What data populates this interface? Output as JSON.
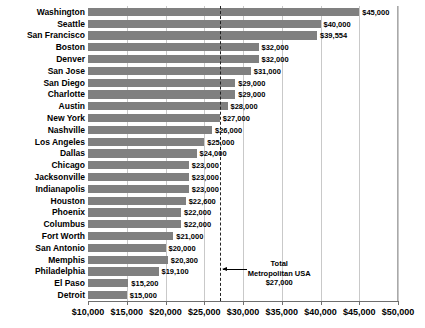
{
  "chart_data": {
    "type": "bar",
    "orientation": "horizontal",
    "title": "",
    "xlabel": "",
    "ylabel": "",
    "xlim": [
      10000,
      50000
    ],
    "xticks": [
      10000,
      15000,
      20000,
      25000,
      30000,
      35000,
      40000,
      45000,
      50000
    ],
    "xtick_labels": [
      "$10,000",
      "$15,000",
      "$20,000",
      "$25,000",
      "$30,000",
      "$35,000",
      "$40,000",
      "$45,000",
      "$50,000"
    ],
    "grid": true,
    "legend": "none",
    "bar_color": "#808080",
    "categories": [
      "Washington",
      "Seattle",
      "San Francisco",
      "Boston",
      "Denver",
      "San Jose",
      "San Diego",
      "Charlotte",
      "Austin",
      "New York",
      "Nashville",
      "Los Angeles",
      "Dallas",
      "Chicago",
      "Jacksonville",
      "Indianapolis",
      "Houston",
      "Phoenix",
      "Columbus",
      "Fort Worth",
      "San Antonio",
      "Memphis",
      "Philadelphia",
      "El Paso",
      "Detroit"
    ],
    "values": [
      45000,
      40000,
      39554,
      32000,
      32000,
      31000,
      29000,
      29000,
      28000,
      27000,
      26000,
      25000,
      24000,
      23000,
      23000,
      23000,
      22600,
      22000,
      22000,
      21000,
      20000,
      20300,
      19100,
      15200,
      15000
    ],
    "value_labels": [
      "$45,000",
      "$40,000",
      "$39,554",
      "$32,000",
      "$32,000",
      "$31,000",
      "$29,000",
      "$29,000",
      "$28,000",
      "$27,000",
      "$26,000",
      "$25,000",
      "$24,000",
      "$23,000",
      "$23,000",
      "$23,000",
      "$22,600",
      "$22,000",
      "$22,000",
      "$21,000",
      "$20,000",
      "$20,300",
      "$19,100",
      "$15,200",
      "$15,000"
    ],
    "annotation": {
      "line_value": 27000,
      "line_style": "dashed",
      "label_line1": "Total",
      "label_line2": "Metropolitan USA",
      "label_line3": "$27,000"
    }
  }
}
